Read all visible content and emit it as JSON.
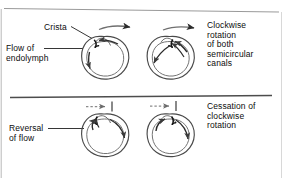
{
  "figure": {
    "title_hidden": "Semicircular canal endolymph flow during and after rotation",
    "panels": {
      "top": {
        "left_labels": {
          "crista": "Crista",
          "flow_of_endolymph": "Flow of\nendolymph"
        },
        "right_caption": "Clockwise\nrotation\nof both\nsemicircular\ncanals",
        "motion_arrow": "solid-rightward-arrow",
        "canal_count": 2
      },
      "bottom": {
        "left_label": "Reversal\nof flow",
        "right_caption": "Cessation of\nclockwise\nrotation",
        "motion_arrow": "dashed-rightward-arrow-stopped",
        "canal_count": 2
      }
    },
    "colors": {
      "ink": "#1a1a1a",
      "line": "#555555",
      "divider_top": "#9a9a9a",
      "divider_mid": "#4d4d4d",
      "background": "#ffffff"
    }
  }
}
